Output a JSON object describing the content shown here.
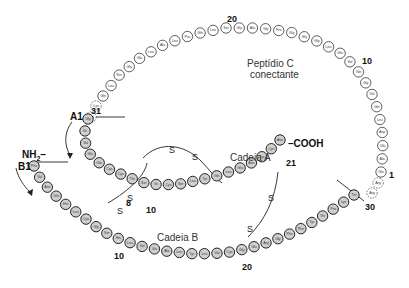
{
  "diagram": {
    "labels": {
      "c_peptide_line1": "Peptídio C",
      "c_peptide_line2": "conectante",
      "chain_a": "Cadeia A",
      "chain_b": "Cadeia B",
      "nh2": "NH2–",
      "cooh": "–COOH",
      "a1": "A1",
      "b1": "B1",
      "disulfide_s": "S"
    },
    "numbers": {
      "c20": "20",
      "c10": "10",
      "c1": "1",
      "c31": "31",
      "b30": "30",
      "a21": "21",
      "a8": "8",
      "a10": "10",
      "b10": "10",
      "b20": "20"
    },
    "c_peptide_residues": [
      "Glu",
      "Ala",
      "Glu",
      "Asp",
      "Leu",
      "Gln",
      "Val",
      "Gly",
      "Gln",
      "Val",
      "Glu",
      "Leu",
      "Gly",
      "Gly",
      "Gly",
      "Pro",
      "Gly",
      "Ala",
      "Gly",
      "Ser",
      "Leu",
      "Gln",
      "Pro",
      "Leu",
      "Ala",
      "Leu",
      "Glu",
      "Gly",
      "Ser",
      "Leu",
      "Gln"
    ],
    "cleavage_residues_right": [
      "Arg",
      "Arg"
    ],
    "cleavage_residues_left": [
      "Lys",
      "Arg"
    ],
    "chain_a_residues": [
      "Gly",
      "Ile",
      "Val",
      "Glu",
      "Gln",
      "Cys",
      "Cys",
      "Thr",
      "Ser",
      "Ile",
      "Cys",
      "Ser",
      "Leu",
      "Tyr",
      "Gln",
      "Leu",
      "Glu",
      "Asn",
      "Tyr",
      "Cys",
      "Asn"
    ],
    "chain_b_residues": [
      "Phe",
      "Val",
      "Asn",
      "Gln",
      "His",
      "Leu",
      "Cys",
      "Gly",
      "Ser",
      "His",
      "Leu",
      "Val",
      "Glu",
      "Ala",
      "Leu",
      "Tyr",
      "Leu",
      "Val",
      "Cys",
      "Gly",
      "Glu",
      "Arg",
      "Gly",
      "Phe",
      "Phe",
      "Tyr",
      "Thr",
      "Pro",
      "Lys",
      "Thr"
    ]
  }
}
